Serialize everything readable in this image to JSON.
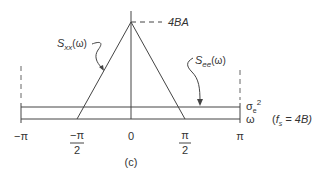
{
  "diagram": {
    "caption": "(c)",
    "peak_label": "4BA",
    "signal_label": {
      "main": "S",
      "sub": "xx",
      "arg": "(ω)"
    },
    "noise_label": {
      "main": "S",
      "sub": "ee",
      "arg": "(ω)"
    },
    "noise_level_label": {
      "main": "σ",
      "sub": "e",
      "sup": "2"
    },
    "axis_label": "ω",
    "sampling_note": {
      "open": "(",
      "f": "f",
      "sub": "s",
      "rest": " = 4B)"
    },
    "ticks": [
      {
        "num": "−π",
        "den": ""
      },
      {
        "num": "−π",
        "den": "2"
      },
      {
        "num": "0",
        "den": ""
      },
      {
        "num": "π",
        "den": "2"
      },
      {
        "num": "π",
        "den": ""
      }
    ],
    "colors": {
      "line": "#444444",
      "text": "#333333"
    }
  }
}
